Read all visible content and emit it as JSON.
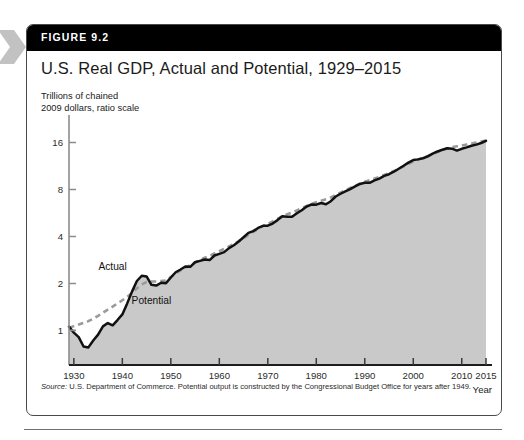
{
  "figure": {
    "label": "FIGURE 9.2",
    "title": "U.S. Real GDP, Actual and Potential, 1929–2015",
    "axis_caption": "Trillions of chained\n2009 dollars, ratio scale",
    "source_prefix": "Source:",
    "source_text": " U.S. Department of Commerce. Potential output is constructed by the Congressional Budget Office for years after 1949."
  },
  "colors": {
    "header_bar": "#000000",
    "header_text": "#ffffff",
    "box_border": "#4a4a4a",
    "title_text": "#1b1b1b",
    "actual_line": "#111111",
    "potential_line": "#9a9a9a",
    "area_fill": "#c9c9c9",
    "axis": "#8c8c8c",
    "tick_label": "#2b2b2b",
    "chevron": "#c2c2c2",
    "rule": "#6f6f6f"
  },
  "chart_data": {
    "type": "line",
    "title": "U.S. Real GDP, Actual and Potential, 1929–2015",
    "xlabel": "Year",
    "ylabel": "Trillions of chained 2009 dollars, ratio scale",
    "yscale": "log",
    "ylim": [
      0.6,
      22
    ],
    "xlim": [
      1929,
      2015
    ],
    "yticks": [
      1,
      2,
      4,
      8,
      16
    ],
    "ytick_labels": [
      "1",
      "2",
      "4",
      "8",
      "16"
    ],
    "xticks": [
      1930,
      1940,
      1950,
      1960,
      1970,
      1980,
      1990,
      2000,
      2010,
      2015
    ],
    "xtick_labels": [
      "1930",
      "1940",
      "1950",
      "1960",
      "1970",
      "1980",
      "1990",
      "2000",
      "2010",
      "2015"
    ],
    "grid": false,
    "legend": "inline-annotations",
    "annotations": [
      {
        "text": "Actual",
        "year": 1938,
        "value": 2.45
      },
      {
        "text": "Potential",
        "year": 1946,
        "value": 1.48
      }
    ],
    "series": [
      {
        "name": "Actual",
        "style": "solid",
        "color": "#111111",
        "filled_area": true,
        "x": [
          1929,
          1930,
          1931,
          1932,
          1933,
          1934,
          1935,
          1936,
          1937,
          1938,
          1939,
          1940,
          1941,
          1942,
          1943,
          1944,
          1945,
          1946,
          1947,
          1948,
          1949,
          1950,
          1951,
          1952,
          1953,
          1954,
          1955,
          1956,
          1957,
          1958,
          1959,
          1960,
          1961,
          1962,
          1963,
          1964,
          1965,
          1966,
          1967,
          1968,
          1969,
          1970,
          1971,
          1972,
          1973,
          1974,
          1975,
          1976,
          1977,
          1978,
          1979,
          1980,
          1981,
          1982,
          1983,
          1984,
          1985,
          1986,
          1987,
          1988,
          1989,
          1990,
          1991,
          1992,
          1993,
          1994,
          1995,
          1996,
          1997,
          1998,
          1999,
          2000,
          2001,
          2002,
          2003,
          2004,
          2005,
          2006,
          2007,
          2008,
          2009,
          2010,
          2011,
          2012,
          2013,
          2014,
          2015
        ],
        "y": [
          1.057,
          0.967,
          0.905,
          0.788,
          0.778,
          0.862,
          0.939,
          1.061,
          1.115,
          1.078,
          1.165,
          1.266,
          1.49,
          1.772,
          2.073,
          2.24,
          2.217,
          1.961,
          1.939,
          2.02,
          2.008,
          2.184,
          2.36,
          2.456,
          2.571,
          2.556,
          2.734,
          2.792,
          2.848,
          2.824,
          3.02,
          3.097,
          3.174,
          3.367,
          3.513,
          3.717,
          3.957,
          4.216,
          4.329,
          4.538,
          4.679,
          4.688,
          4.84,
          5.094,
          5.384,
          5.354,
          5.344,
          5.633,
          5.892,
          6.22,
          6.415,
          6.398,
          6.557,
          6.438,
          6.732,
          7.218,
          7.517,
          7.783,
          8.05,
          8.387,
          8.69,
          8.846,
          8.833,
          9.147,
          9.402,
          9.782,
          10.031,
          10.408,
          10.876,
          11.361,
          11.894,
          12.36,
          12.484,
          12.698,
          13.062,
          13.576,
          14.034,
          14.399,
          14.704,
          14.63,
          14.214,
          14.592,
          14.911,
          15.274,
          15.521,
          15.902,
          16.397
        ]
      },
      {
        "name": "Potential",
        "style": "dashed",
        "color": "#9a9a9a",
        "filled_area": false,
        "x": [
          1929,
          1930,
          1931,
          1932,
          1933,
          1934,
          1935,
          1936,
          1937,
          1938,
          1939,
          1940,
          1941,
          1942,
          1943,
          1944,
          1945,
          1946,
          1947,
          1948,
          1949,
          1950,
          1951,
          1952,
          1953,
          1954,
          1955,
          1956,
          1957,
          1958,
          1959,
          1960,
          1961,
          1962,
          1963,
          1964,
          1965,
          1966,
          1967,
          1968,
          1969,
          1970,
          1971,
          1972,
          1973,
          1974,
          1975,
          1976,
          1977,
          1978,
          1979,
          1980,
          1981,
          1982,
          1983,
          1984,
          1985,
          1986,
          1987,
          1988,
          1989,
          1990,
          1991,
          1992,
          1993,
          1994,
          1995,
          1996,
          1997,
          1998,
          1999,
          2000,
          2001,
          2002,
          2003,
          2004,
          2005,
          2006,
          2007,
          2008,
          2009,
          2010,
          2011,
          2012,
          2013,
          2014,
          2015
        ],
        "y": [
          1.04,
          1.065,
          1.09,
          1.118,
          1.146,
          1.19,
          1.24,
          1.3,
          1.36,
          1.42,
          1.49,
          1.56,
          1.64,
          1.74,
          1.86,
          1.97,
          2.04,
          2.06,
          2.06,
          2.07,
          2.09,
          2.2,
          2.31,
          2.42,
          2.53,
          2.62,
          2.73,
          2.83,
          2.92,
          3.0,
          3.11,
          3.22,
          3.33,
          3.45,
          3.58,
          3.73,
          3.9,
          4.09,
          4.28,
          4.47,
          4.66,
          4.83,
          4.99,
          5.18,
          5.39,
          5.56,
          5.7,
          5.87,
          6.07,
          6.28,
          6.48,
          6.64,
          6.79,
          6.93,
          7.12,
          7.38,
          7.65,
          7.91,
          8.18,
          8.45,
          8.72,
          8.97,
          9.18,
          9.4,
          9.64,
          9.9,
          10.18,
          10.5,
          10.86,
          11.26,
          11.69,
          12.11,
          12.46,
          12.78,
          13.13,
          13.52,
          13.93,
          14.32,
          14.68,
          14.97,
          15.15,
          15.33,
          15.53,
          15.76,
          16.0,
          16.25,
          16.52
        ]
      }
    ]
  }
}
